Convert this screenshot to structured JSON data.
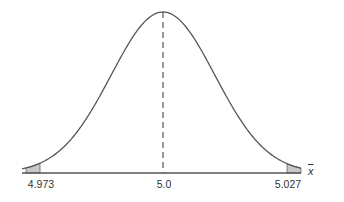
{
  "chart_data": {
    "type": "line",
    "title": "",
    "xlabel": "x̄",
    "ylabel": "",
    "mean": 5.0,
    "x_ticks": [
      {
        "value": 4.973,
        "label": "4.973"
      },
      {
        "value": 5.0,
        "label": "5.0"
      },
      {
        "value": 5.027,
        "label": "5.027"
      }
    ],
    "shaded_regions": [
      {
        "from": "-inf",
        "to": 4.973,
        "side": "left"
      },
      {
        "from": 5.027,
        "to": "inf",
        "side": "right"
      }
    ],
    "center_line": {
      "x": 5.0,
      "style": "dashed"
    },
    "grid": false,
    "legend": null,
    "colors": {
      "curve": "#555555",
      "shade": "#c8c8c8",
      "axis": "#555555"
    }
  },
  "labels": {
    "left_tick": "4.973",
    "center_tick": "5.0",
    "right_tick": "5.027",
    "axis_variable": "x"
  }
}
